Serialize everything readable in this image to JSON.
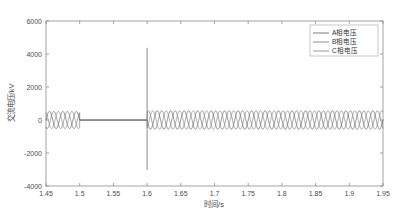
{
  "chart_data": {
    "type": "line",
    "title": "",
    "xlabel": "时间/s",
    "ylabel": "交流电压/kV",
    "xlim": [
      1.45,
      1.95
    ],
    "ylim": [
      -4000,
      6000
    ],
    "grid": false,
    "xticks": [
      "1.45",
      "1.5",
      "1.55",
      "1.6",
      "1.65",
      "1.7",
      "1.75",
      "1.8",
      "1.85",
      "1.9",
      "1.95"
    ],
    "xtick_values": [
      1.45,
      1.5,
      1.55,
      1.6,
      1.65,
      1.7,
      1.75,
      1.8,
      1.85,
      1.9,
      1.95
    ],
    "yticks": [
      "6000",
      "4000",
      "2000",
      "0",
      "-2000",
      "-4000"
    ],
    "ytick_values": [
      6000,
      4000,
      2000,
      0,
      -2000,
      -4000
    ],
    "legend_position": "upper right",
    "series": [
      {
        "name": "A相电压",
        "color": "#5a5a5a",
        "description": "三相交流电压A相，1.45–1.50 s 正常工频振荡，1.50–1.60 s 电压跌落为零，1.60 s 发生暂态尖峰后恢复振荡",
        "frequency_hz": 50,
        "phase_deg": 0,
        "amplitude_before_kv": 520,
        "amplitude_after_kv": 560,
        "fault_start_s": 1.5,
        "fault_clear_s": 1.6,
        "fault_amplitude_kv": 0,
        "spike_time_s": 1.6,
        "spike_max_kv": 4350,
        "spike_min_kv": -3000
      },
      {
        "name": "B相电压",
        "color": "#6e6e6e",
        "description": "三相交流电压B相，相位滞后A相120度",
        "frequency_hz": 50,
        "phase_deg": -120,
        "amplitude_before_kv": 520,
        "amplitude_after_kv": 560,
        "fault_start_s": 1.5,
        "fault_clear_s": 1.6,
        "fault_amplitude_kv": 0,
        "spike_time_s": 1.6,
        "spike_max_kv": 0,
        "spike_min_kv": 0
      },
      {
        "name": "C相电压",
        "color": "#828282",
        "description": "三相交流电压C相，相位超前A相120度",
        "frequency_hz": 50,
        "phase_deg": 120,
        "amplitude_before_kv": 520,
        "amplitude_after_kv": 560,
        "fault_start_s": 1.5,
        "fault_clear_s": 1.6,
        "fault_amplitude_kv": 0,
        "spike_time_s": 1.6,
        "spike_max_kv": 0,
        "spike_min_kv": 0
      }
    ],
    "annotations": [
      {
        "label": "电压跌落区间",
        "x_start": 1.5,
        "x_end": 1.6,
        "value_kv": 0
      },
      {
        "label": "暂态尖峰",
        "x": 1.6,
        "max_kv": 4350,
        "min_kv": -3000
      }
    ]
  },
  "legend": {
    "items": [
      {
        "label": "A相电压"
      },
      {
        "label": "B相电压"
      },
      {
        "label": "C相电压"
      }
    ]
  }
}
